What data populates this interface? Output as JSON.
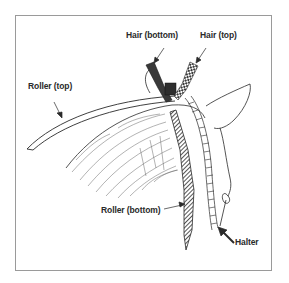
{
  "diagram": {
    "labels": {
      "hair_bottom": "Hair (bottom)",
      "hair_top": "Hair (top)",
      "roller_top": "Roller (top)",
      "roller_bottom": "Roller (bottom)",
      "halter": "Halter"
    },
    "colors": {
      "line": "#2a2a2a",
      "frame": "#9a9a9a",
      "background": "#ffffff"
    }
  }
}
